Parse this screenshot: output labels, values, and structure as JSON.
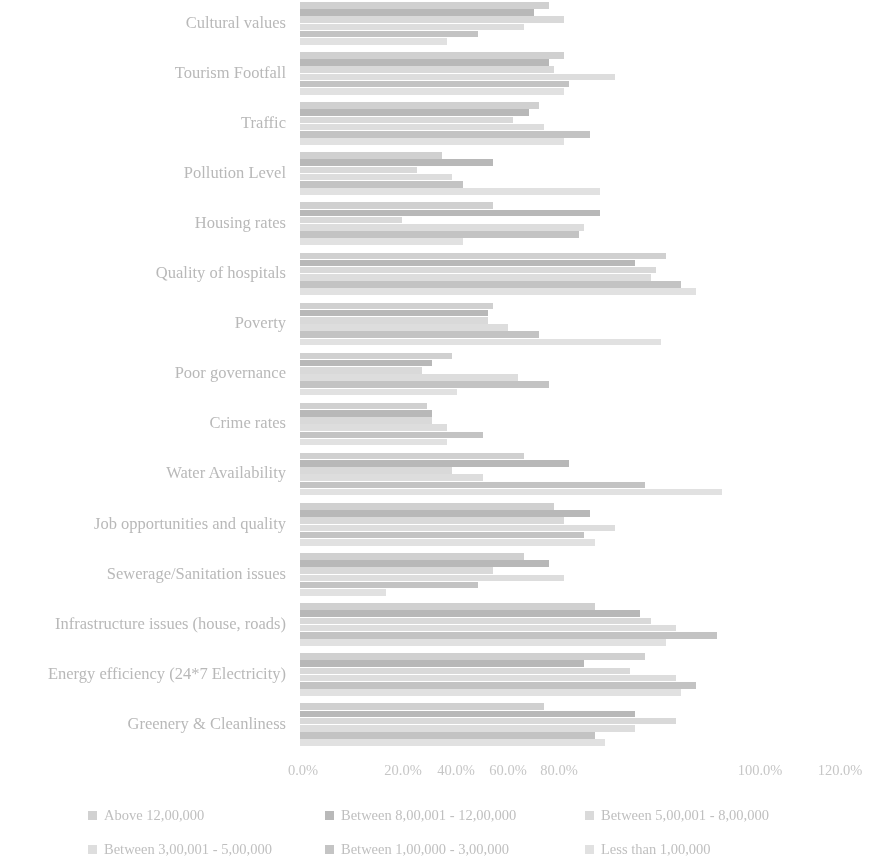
{
  "chart_data": {
    "type": "bar",
    "orientation": "horizontal",
    "grouped": true,
    "title": "",
    "subtitle": "",
    "xlabel": "",
    "ylabel": "",
    "xlim": [
      0,
      120
    ],
    "xticks": [
      "0.0%",
      "20.0%",
      "40.0%",
      "60.0%",
      "80.0%",
      "100.0%",
      "120.0%"
    ],
    "xtick_values": [
      0,
      20,
      40,
      60,
      80,
      100,
      120
    ],
    "grid": false,
    "legend_position": "bottom",
    "value_suffix": "%",
    "categories": [
      "Cultural values",
      "Tourism Footfall",
      "Traffic",
      "Pollution Level",
      "Housing rates",
      "Quality of hospitals",
      "Poverty",
      "Poor governance",
      "Crime rates",
      "Water Availability",
      "Job opportunities and quality",
      "Sewerage/Sanitation issues",
      "Infrastructure issues (house, roads)",
      "Energy efficiency (24*7 Electricity)",
      "Greenery & Cleanliness"
    ],
    "series": [
      {
        "name": "Above 12,00,000",
        "color": "#b4b4b4",
        "values": [
          49.0,
          52.0,
          47.0,
          28.0,
          38.0,
          72.0,
          38.0,
          30.0,
          25.0,
          44.0,
          50.0,
          44.0,
          58.0,
          68.0,
          48.0
        ]
      },
      {
        "name": "Between 8,00,001 - 12,00,000",
        "color": "#8e8e8e",
        "values": [
          46.0,
          49.0,
          45.0,
          38.0,
          59.0,
          66.0,
          37.0,
          26.0,
          26.0,
          53.0,
          57.0,
          49.0,
          67.0,
          56.0,
          66.0
        ]
      },
      {
        "name": "Between 5,00,001 - 8,00,000",
        "color": "#c3c3c3",
        "values": [
          52.0,
          50.0,
          42.0,
          23.0,
          20.0,
          70.0,
          37.0,
          24.0,
          26.0,
          30.0,
          52.0,
          38.0,
          69.0,
          65.0,
          74.0
        ]
      },
      {
        "name": "Between 3,00,001 - 5,00,000",
        "color": "#c9c9c9",
        "values": [
          44.0,
          62.0,
          48.0,
          30.0,
          56.0,
          69.0,
          41.0,
          43.0,
          29.0,
          36.0,
          62.0,
          52.0,
          74.0,
          74.0,
          66.0
        ]
      },
      {
        "name": "Between 1,00,000 - 3,00,000",
        "color": "#a0a0a0",
        "values": [
          35.0,
          53.0,
          57.0,
          32.0,
          55.0,
          75.0,
          47.0,
          49.0,
          36.0,
          68.0,
          56.0,
          35.0,
          82.0,
          78.0,
          58.0
        ]
      },
      {
        "name": "Less than 1,00,000",
        "color": "#cfcfcf",
        "values": [
          29.0,
          52.0,
          52.0,
          59.0,
          32.0,
          78.0,
          71.0,
          31.0,
          29.0,
          83.0,
          58.0,
          17.0,
          72.0,
          75.0,
          60.0
        ]
      }
    ]
  },
  "axis": {
    "ticks": [
      {
        "label": "0.0%",
        "x": 303
      },
      {
        "label": "20.0%",
        "x": 403
      },
      {
        "label": "40.0%",
        "x": 456
      },
      {
        "label": "60.0%",
        "x": 508
      },
      {
        "label": "80.0%",
        "x": 559
      },
      {
        "label": "100.0%",
        "x": 760
      },
      {
        "label": "120.0%",
        "x": 840
      }
    ]
  },
  "legend": {
    "items": [
      {
        "label": "Above 12,00,000",
        "color": "#b4b4b4",
        "x": 88,
        "y": 6
      },
      {
        "label": "Between 8,00,001 - 12,00,000",
        "color": "#8e8e8e",
        "x": 325,
        "y": 6
      },
      {
        "label": "Between 5,00,001 - 8,00,000",
        "color": "#c3c3c3",
        "x": 585,
        "y": 6
      },
      {
        "label": "Between 3,00,001 - 5,00,000",
        "color": "#c9c9c9",
        "x": 88,
        "y": 40
      },
      {
        "label": "Between 1,00,000 - 3,00,000",
        "color": "#a0a0a0",
        "x": 325,
        "y": 40
      },
      {
        "label": "Less than 1,00,000",
        "color": "#cfcfcf",
        "x": 585,
        "y": 40
      }
    ]
  }
}
